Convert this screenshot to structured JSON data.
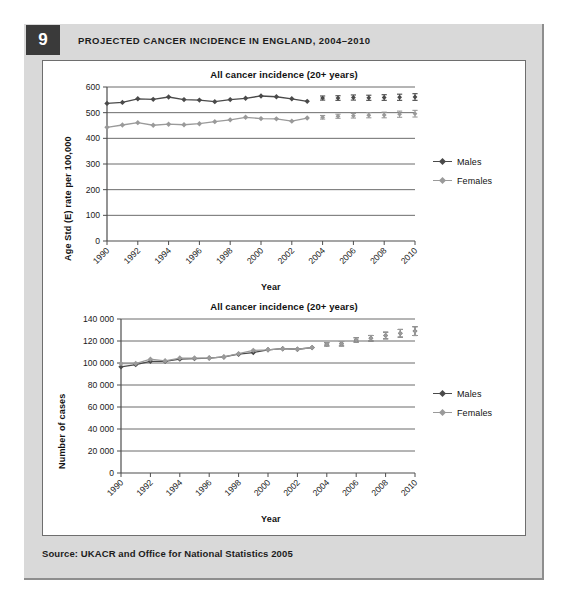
{
  "figure": {
    "number": "9",
    "title": "PROJECTED CANCER INCIDENCE IN ENGLAND, 2004–2010",
    "source": "Source: UKACR and Office for National Statistics 2005"
  },
  "colors": {
    "males": "#4a4a4a",
    "females": "#9a9a9a",
    "axis": "#4d4d4d",
    "gridline": "#6b6b6b",
    "panel": "#d9d9d9",
    "badge": "#3a3a3a",
    "canvas": "#ffffff"
  },
  "chart_data": [
    {
      "type": "line",
      "id": "rate-chart",
      "title": "All cancer incidence (20+ years)",
      "xlabel": "Year",
      "ylabel": "Age Std (E) rate per 100,000",
      "ylim": [
        0,
        600
      ],
      "yticks": [
        0,
        100,
        200,
        300,
        400,
        500,
        600
      ],
      "ytick_labels": [
        "0",
        "100",
        "200",
        "300",
        "400",
        "500",
        "600"
      ],
      "xlim": [
        1990,
        2010
      ],
      "xticks": [
        1990,
        1992,
        1994,
        1996,
        1998,
        2000,
        2002,
        2004,
        2006,
        2008,
        2010
      ],
      "xtick_labels": [
        "1990",
        "1992",
        "1994",
        "1996",
        "1998",
        "2000",
        "2002",
        "2004",
        "2006",
        "2008",
        "2010"
      ],
      "grid": true,
      "legend_position": "right",
      "observed_years": [
        1990,
        1991,
        1992,
        1993,
        1994,
        1995,
        1996,
        1997,
        1998,
        1999,
        2000,
        2001,
        2002,
        2003
      ],
      "projected_years": [
        2004,
        2005,
        2006,
        2007,
        2008,
        2009,
        2010
      ],
      "series": [
        {
          "name": "Males",
          "color": "#4a4a4a",
          "observed": [
            536,
            540,
            554,
            552,
            561,
            551,
            549,
            543,
            551,
            556,
            565,
            562,
            554,
            544
          ],
          "projected": [
            557,
            557,
            559,
            558,
            559,
            560,
            561
          ],
          "projected_err_low": [
            549,
            548,
            549,
            548,
            548,
            548,
            548
          ],
          "projected_err_high": [
            565,
            566,
            569,
            568,
            570,
            572,
            574
          ]
        },
        {
          "name": "Females",
          "color": "#9a9a9a",
          "observed": [
            443,
            452,
            461,
            451,
            455,
            453,
            457,
            465,
            472,
            482,
            477,
            476,
            467,
            479
          ],
          "projected": [
            482,
            486,
            488,
            490,
            491,
            494,
            496
          ],
          "projected_err_low": [
            475,
            478,
            479,
            480,
            480,
            482,
            483
          ],
          "projected_err_high": [
            489,
            494,
            497,
            500,
            502,
            506,
            509
          ]
        }
      ]
    },
    {
      "type": "line",
      "id": "cases-chart",
      "title": "All cancer incidence (20+ years)",
      "xlabel": "Year",
      "ylabel": "Number of cases",
      "ylim": [
        0,
        140000
      ],
      "yticks": [
        0,
        20000,
        40000,
        60000,
        80000,
        100000,
        120000,
        140000
      ],
      "ytick_labels": [
        "0",
        "20 000",
        "40 000",
        "60 000",
        "80 000",
        "100 000",
        "120 000",
        "140 000"
      ],
      "xlim": [
        1990,
        2010
      ],
      "xticks": [
        1990,
        1992,
        1994,
        1996,
        1998,
        2000,
        2002,
        2004,
        2006,
        2008,
        2010
      ],
      "xtick_labels": [
        "1990",
        "1992",
        "1994",
        "1996",
        "1998",
        "2000",
        "2002",
        "2004",
        "2006",
        "2008",
        "2010"
      ],
      "grid": true,
      "legend_position": "right",
      "observed_years": [
        1990,
        1991,
        1992,
        1993,
        1994,
        1995,
        1996,
        1997,
        1998,
        1999,
        2000,
        2001,
        2002,
        2003
      ],
      "projected_years": [
        2004,
        2005,
        2006,
        2007,
        2008,
        2009,
        2010
      ],
      "series": [
        {
          "name": "Males",
          "color": "#4a4a4a",
          "observed": [
            96500,
            98500,
            101500,
            101500,
            103500,
            104000,
            104500,
            105500,
            108000,
            109500,
            112000,
            113000,
            112500,
            114000
          ],
          "projected": [
            117000,
            117500,
            121000,
            122500,
            125000,
            127000,
            129000
          ],
          "projected_err_low": [
            115500,
            115500,
            119000,
            120000,
            122000,
            123500,
            125000
          ],
          "projected_err_high": [
            118500,
            119500,
            123000,
            125000,
            128000,
            130500,
            133000
          ]
        },
        {
          "name": "Females",
          "color": "#9a9a9a",
          "observed": [
            99500,
            99500,
            103500,
            102000,
            104500,
            104500,
            104500,
            105500,
            108500,
            111500,
            112000,
            113000,
            112500,
            114000
          ],
          "projected": [
            117000,
            117500,
            121000,
            122500,
            125000,
            127000,
            129000
          ],
          "projected_err_low": [
            115500,
            115500,
            119000,
            120000,
            122000,
            123500,
            125000
          ],
          "projected_err_high": [
            118500,
            119500,
            123000,
            125000,
            128000,
            130500,
            133000
          ]
        }
      ]
    }
  ]
}
